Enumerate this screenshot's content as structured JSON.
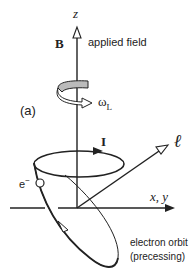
{
  "diagram": {
    "axes": {
      "z_label": "z",
      "xy_label": "x, y"
    },
    "field": {
      "symbol": "B",
      "description": "applied field"
    },
    "precession": {
      "symbol": "ω",
      "subscript": "L"
    },
    "panel_label": "(a)",
    "current": {
      "symbol": "I"
    },
    "angular_momentum": {
      "symbol": "ℓ"
    },
    "electron": {
      "symbol": "e",
      "superscript": "−"
    },
    "orbit": {
      "line1": "electron orbit",
      "line2": "(precessing)"
    },
    "colors": {
      "line": "#222222",
      "arrow_fill": "#ffffff",
      "band_fill": "#bbbbbb"
    }
  }
}
